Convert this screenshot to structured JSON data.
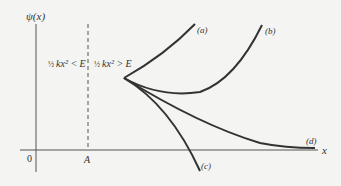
{
  "diagram": {
    "y_axis_label": "ψ(x)",
    "x_axis_label": "x",
    "origin_label": "0",
    "turning_point_label": "A",
    "region_left_label": {
      "frac": "½",
      "expr": "kx² < E"
    },
    "region_right_label": {
      "frac": "½",
      "expr": "kx² > E"
    },
    "curves": [
      {
        "id": "a",
        "label": "(a)",
        "behavior": "diverges upward steeply"
      },
      {
        "id": "b",
        "label": "(b)",
        "behavior": "dips then diverges upward"
      },
      {
        "id": "c",
        "label": "(c)",
        "behavior": "diverges downward, crosses x-axis"
      },
      {
        "id": "d",
        "label": "(d)",
        "behavior": "decays asymptotically to zero"
      }
    ],
    "colors": {
      "curve": "#333333",
      "axis": "#444444",
      "background": "#f4f4f2"
    }
  }
}
